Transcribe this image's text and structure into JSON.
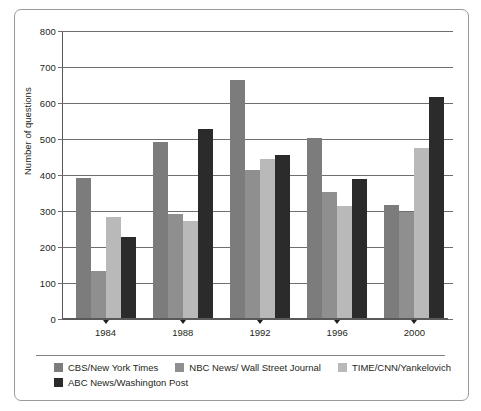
{
  "chart_data": {
    "type": "bar",
    "title": "",
    "xlabel": "",
    "ylabel": "Number of questions",
    "categories": [
      "1984",
      "1988",
      "1992",
      "1996",
      "2000"
    ],
    "series": [
      {
        "name": "CBS/New York Times",
        "color": "#7c7c7c",
        "values": [
          390,
          490,
          660,
          500,
          315
        ]
      },
      {
        "name": "NBC News/ Wall Street Journal",
        "color": "#8f8f8f",
        "values": [
          130,
          290,
          412,
          350,
          295
        ]
      },
      {
        "name": "TIME/CNN/Yankelovich",
        "color": "#b9b9b9",
        "values": [
          280,
          270,
          442,
          310,
          472
        ]
      },
      {
        "name": "ABC News/Washington Post",
        "color": "#2b2b2b",
        "values": [
          225,
          525,
          452,
          385,
          615
        ]
      }
    ],
    "ylim": [
      0,
      800
    ],
    "ytick_values": [
      0,
      100,
      200,
      300,
      400,
      500,
      600,
      700,
      800
    ],
    "ytick_labels": [
      "0",
      "100",
      "200",
      "300",
      "400",
      "500",
      "600",
      "700",
      "800"
    ],
    "grid": true,
    "legend_position": "bottom"
  },
  "legend": {
    "rows": [
      [
        {
          "label": "CBS/New York Times",
          "color": "#7c7c7c",
          "icon": "legend-swatch"
        },
        {
          "label": "NBC News/ Wall Street Journal",
          "color": "#8f8f8f",
          "icon": "legend-swatch"
        },
        {
          "label": "TIME/CNN/Yankelovich",
          "color": "#b9b9b9",
          "icon": "legend-swatch"
        }
      ],
      [
        {
          "label": "ABC News/Washington Post",
          "color": "#2b2b2b",
          "icon": "legend-swatch"
        }
      ]
    ]
  },
  "style": {
    "frame_color": "#9a9a9a",
    "axis_color": "#58595b",
    "grid_color": "#6d6e71",
    "text_color": "#231f20",
    "background": "#ffffff"
  }
}
